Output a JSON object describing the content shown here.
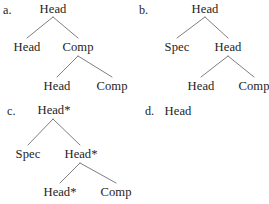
{
  "figure": {
    "background_color": "#ffffff",
    "text_color": "#1e1e22",
    "line_color": "#6f6f75"
  },
  "trees": {
    "a": {
      "label": "a.",
      "nodes": {
        "root": "Head",
        "left1": "Head",
        "right1": "Comp",
        "left2": "Head",
        "right2": "Comp"
      }
    },
    "b": {
      "label": "b.",
      "nodes": {
        "root": "Head",
        "left1": "Spec",
        "right1": "Head",
        "left2": "Head",
        "right2": "Comp"
      }
    },
    "c": {
      "label": "c.",
      "nodes": {
        "root": "Head*",
        "left1": "Spec",
        "right1": "Head*",
        "left2": "Head*",
        "right2": "Comp"
      }
    },
    "d": {
      "label": "d.",
      "nodes": {
        "root": "Head"
      }
    }
  }
}
